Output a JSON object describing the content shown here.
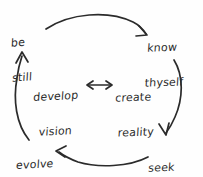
{
  "diagram": {
    "style": "hand-drawn sketch",
    "stroke_color": "#2b2b2b",
    "background_color": "#fefefe",
    "nodes": [
      {
        "id": "be-still",
        "line1": "be",
        "line2": "still",
        "position": "top-left"
      },
      {
        "id": "know-thyself",
        "line1": "know",
        "line2": "thyself",
        "position": "top-right"
      },
      {
        "id": "seek-support",
        "line1": "seek",
        "line2": "support",
        "position": "bottom-right"
      },
      {
        "id": "evolve",
        "line1": "evolve",
        "line2": "",
        "position": "bottom-left"
      },
      {
        "id": "develop-vision",
        "line1": "develop",
        "line2": "vision",
        "position": "center-left"
      },
      {
        "id": "create-reality",
        "line1": "create",
        "line2": "reality",
        "position": "center-right"
      }
    ],
    "connectors": [
      {
        "id": "arrow-be-still-to-know-thyself",
        "from": "be-still",
        "to": "know-thyself",
        "direction": "one-way",
        "shape": "arc-top"
      },
      {
        "id": "arrow-know-thyself-to-seek-support",
        "from": "know-thyself",
        "to": "seek-support",
        "direction": "one-way",
        "shape": "arc-right"
      },
      {
        "id": "arrow-seek-support-to-evolve",
        "from": "seek-support",
        "to": "evolve",
        "direction": "one-way",
        "shape": "arc-bottom"
      },
      {
        "id": "arrow-evolve-to-be-still",
        "from": "evolve",
        "to": "be-still",
        "direction": "one-way",
        "shape": "arc-left"
      },
      {
        "id": "arrow-develop-vision-create-reality",
        "from": "develop-vision",
        "to": "create-reality",
        "direction": "two-way",
        "shape": "straight-center"
      }
    ]
  }
}
